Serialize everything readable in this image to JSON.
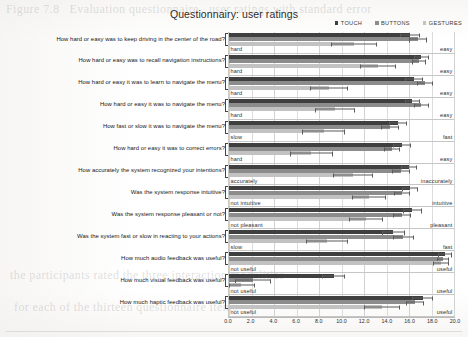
{
  "chart_data": {
    "type": "bar",
    "orientation": "horizontal",
    "title": "Questionnairy: user ratings",
    "xlabel": "",
    "ylabel": "",
    "xlim": [
      0.0,
      20.0
    ],
    "xticks": [
      "0.0",
      "2.0",
      "4.0",
      "6.0",
      "8.0",
      "10.0",
      "12.0",
      "14.0",
      "16.0",
      "18.0",
      "20.0"
    ],
    "grid": true,
    "legend_position": "top-right",
    "legend": [
      {
        "name": "TOUCH",
        "color": "#3f3f3f"
      },
      {
        "name": "BUTTONS",
        "color": "#8c8c8c"
      },
      {
        "name": "GESTURES",
        "color": "#c2c2c2"
      }
    ],
    "series": [
      {
        "name": "TOUCH",
        "color": "#3f3f3f",
        "values": [
          16.1,
          17.1,
          16.4,
          16.3,
          15.0,
          15.4,
          16.0,
          16.1,
          16.3,
          14.6,
          19.2,
          9.3,
          17.2
        ],
        "errors": [
          0.9,
          0.7,
          0.8,
          0.7,
          0.8,
          0.8,
          0.7,
          0.7,
          0.8,
          1.0,
          0.6,
          1.0,
          0.9
        ]
      },
      {
        "name": "BUTTONS",
        "color": "#8c8c8c",
        "values": [
          16.8,
          16.9,
          17.4,
          17.1,
          14.3,
          14.5,
          15.3,
          15.4,
          15.4,
          15.5,
          19.0,
          2.1,
          16.5
        ],
        "errors": [
          0.8,
          0.6,
          0.7,
          0.7,
          0.8,
          0.7,
          0.8,
          0.7,
          0.8,
          0.9,
          0.5,
          1.6,
          0.8
        ]
      },
      {
        "name": "GESTURES",
        "color": "#c2c2c2",
        "values": [
          11.1,
          13.2,
          8.9,
          9.4,
          8.4,
          7.3,
          11.0,
          12.4,
          12.2,
          8.7,
          18.8,
          1.1,
          13.6
        ],
        "errors": [
          2.0,
          1.6,
          1.7,
          1.8,
          1.9,
          1.9,
          1.8,
          1.5,
          1.5,
          1.9,
          0.7,
          1.2,
          1.6
        ]
      }
    ],
    "categories": [
      "How hard or easy was to keep driving in the center of the road?",
      "How hard or easy was to recall navigation instructions?",
      "How hard or easy it was to learn to navigate the menu?",
      "How hard or easy it was to navigate the menu?",
      "How fast or slow it was to navigate the menu?",
      "How hard or easy it was to correct errors?",
      "How accurately the system recognized your intentions?",
      "Was the system response intuitive?",
      "Was the system response pleasant or not?",
      "Was the system fast or slow in reacting to your actions?",
      "How much audio feedback was useful?",
      "How much visual feedback was useful?",
      "How much haptic feedback was useful?"
    ],
    "scale_poles": [
      {
        "left": "hard",
        "right": "easy"
      },
      {
        "left": "hard",
        "right": "easy"
      },
      {
        "left": "hard",
        "right": "easy"
      },
      {
        "left": "hard",
        "right": "easy"
      },
      {
        "left": "slow",
        "right": "fast"
      },
      {
        "left": "hard",
        "right": "easy"
      },
      {
        "left": "accurately",
        "right": "inaccurately"
      },
      {
        "left": "not intuitive",
        "right": "intuitive"
      },
      {
        "left": "not pleasant",
        "right": "pleasant"
      },
      {
        "left": "slow",
        "right": "fast"
      },
      {
        "left": "not useful",
        "right": "useful"
      },
      {
        "left": "not useful",
        "right": "useful"
      },
      {
        "left": "not useful",
        "right": "useful"
      }
    ]
  }
}
